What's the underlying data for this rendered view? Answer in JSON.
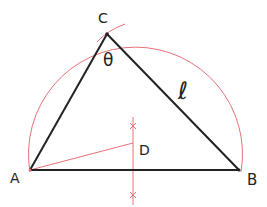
{
  "diagram": {
    "title": "",
    "points": {
      "A": {
        "label": "A",
        "x": 30,
        "y": 170
      },
      "B": {
        "label": "B",
        "x": 239,
        "y": 170
      },
      "C": {
        "label": "C",
        "x": 107,
        "y": 34
      },
      "D": {
        "label": "D",
        "x": 133,
        "y": 143
      }
    },
    "angle_label": "θ",
    "side_label": "ℓ",
    "colors": {
      "triangle": "#222222",
      "construction": "#e8707a"
    }
  }
}
